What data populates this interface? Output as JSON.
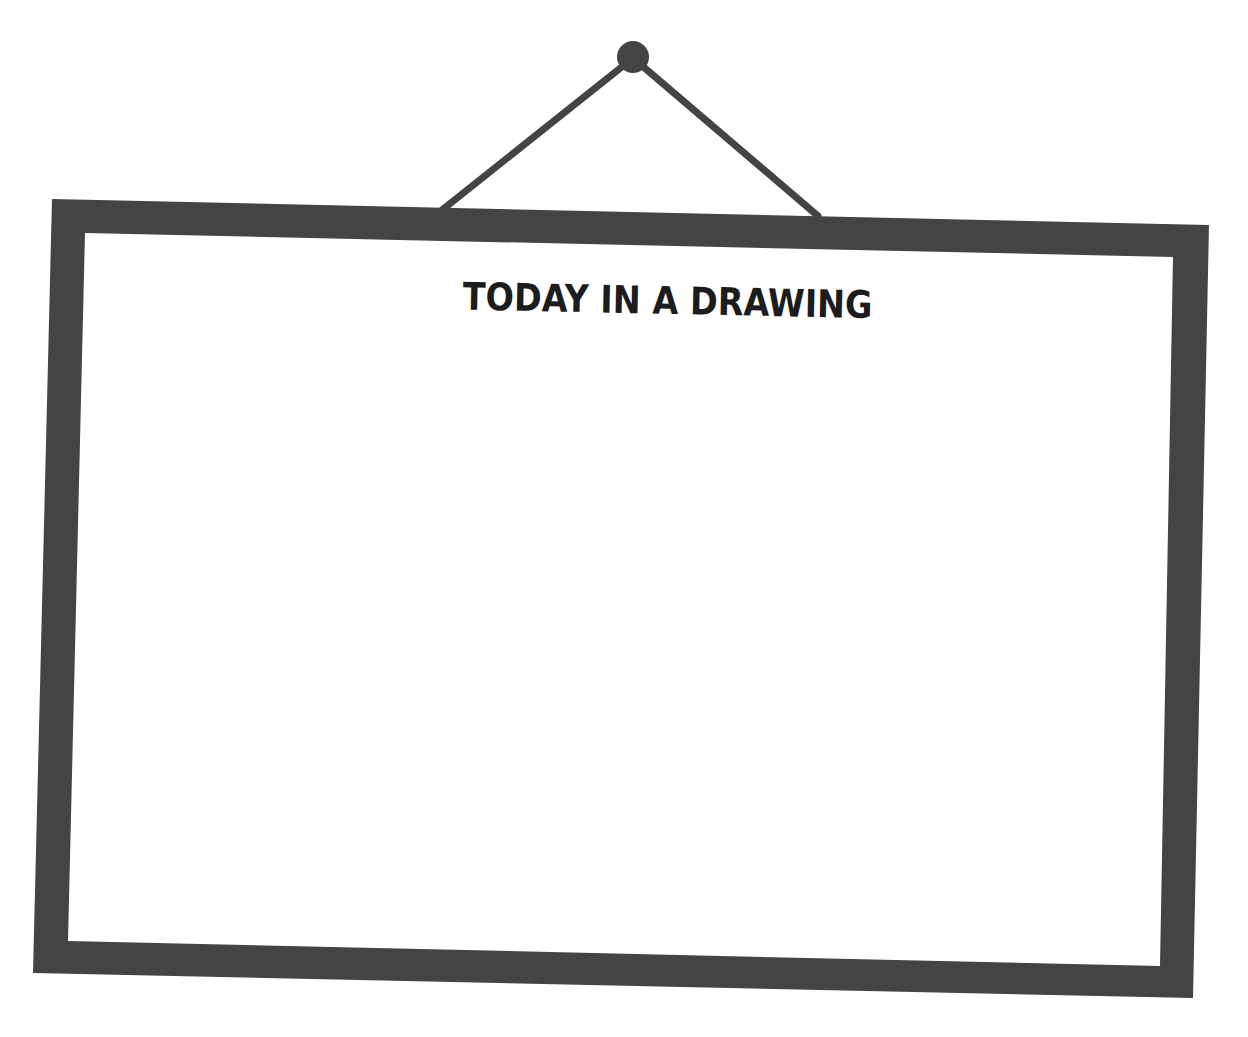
{
  "frame": {
    "title": "TODAY IN A DRAWING",
    "colors": {
      "frame": "#444444",
      "string": "#444444",
      "nail": "#444444",
      "canvas": "#ffffff",
      "title": "#1c1c1c",
      "background": "#ffffff"
    }
  }
}
